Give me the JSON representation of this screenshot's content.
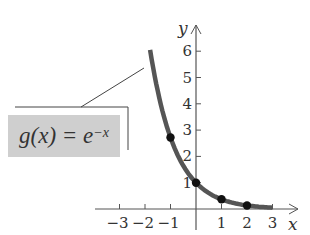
{
  "chart_data": {
    "type": "line",
    "title": "",
    "function_label": "g(x) = e^{-x}",
    "xlabel": "x",
    "ylabel": "y",
    "xlim": [
      -3.5,
      3.5
    ],
    "ylim": [
      0,
      6.5
    ],
    "x_ticks": [
      -3,
      -2,
      -1,
      1,
      2,
      3
    ],
    "y_ticks": [
      1,
      2,
      3,
      4,
      5,
      6
    ],
    "grid": false,
    "series": [
      {
        "name": "g(x) = e^{-x}",
        "domain": [
          -1.8,
          3
        ],
        "color": "#555555"
      }
    ],
    "points": [
      {
        "x": -1,
        "y": 2.718
      },
      {
        "x": 0,
        "y": 1
      },
      {
        "x": 1,
        "y": 0.368
      },
      {
        "x": 2,
        "y": 0.135
      }
    ]
  },
  "labels": {
    "x_axis": "x",
    "y_axis": "y",
    "formula_left": "g(x) = e",
    "formula_exp": "−x",
    "x_tick_labels": [
      "−3",
      "−2",
      "−1",
      "1",
      "2",
      "3"
    ],
    "y_tick_labels": [
      "1",
      "2",
      "3",
      "4",
      "5",
      "6"
    ]
  }
}
